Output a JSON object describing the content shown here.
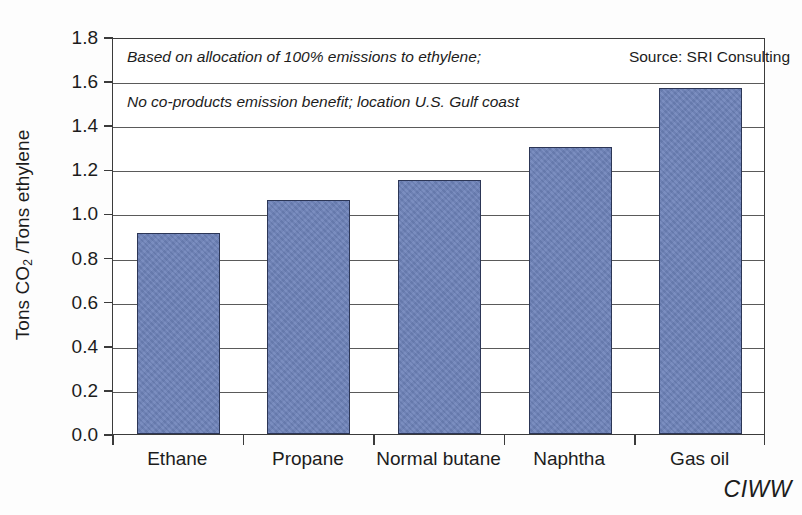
{
  "chart_data": {
    "type": "bar",
    "title": "",
    "xlabel": "",
    "ylabel": "Tons CO2 /Tons ethylene",
    "ylabel_parts": {
      "prefix": "Tons CO",
      "sub": "2",
      "suffix": " /Tons ethylene"
    },
    "categories": [
      "Ethane",
      "Propane",
      "Normal butane",
      "Naphtha",
      "Gas oil"
    ],
    "values": [
      0.91,
      1.06,
      1.15,
      1.3,
      1.57
    ],
    "ylim": [
      0.0,
      1.8
    ],
    "ytick_values": [
      0.0,
      0.2,
      0.4,
      0.6,
      0.8,
      1.0,
      1.2,
      1.4,
      1.6,
      1.8
    ],
    "ytick_labels": [
      "0.0",
      "0.2",
      "0.4",
      "0.6",
      "0.8",
      "1.0",
      "1.2",
      "1.4",
      "1.6",
      "1.8"
    ],
    "grid": true,
    "legend": "none",
    "bar_color": "#6d82b9",
    "bar_edge_color": "#2c3656",
    "annotations": [
      "Based on allocation of 100% emissions to ethylene;",
      "No co-products emission benefit; location U.S. Gulf coast"
    ],
    "source": "Source: SRI Consulting"
  },
  "figure": {
    "annotation_line1": "Based on allocation of 100% emissions to ethylene;",
    "annotation_line2": "No co-products emission benefit; location U.S. Gulf coast",
    "source_text": "Source: SRI Consulting",
    "logo_text": "CIWW"
  }
}
